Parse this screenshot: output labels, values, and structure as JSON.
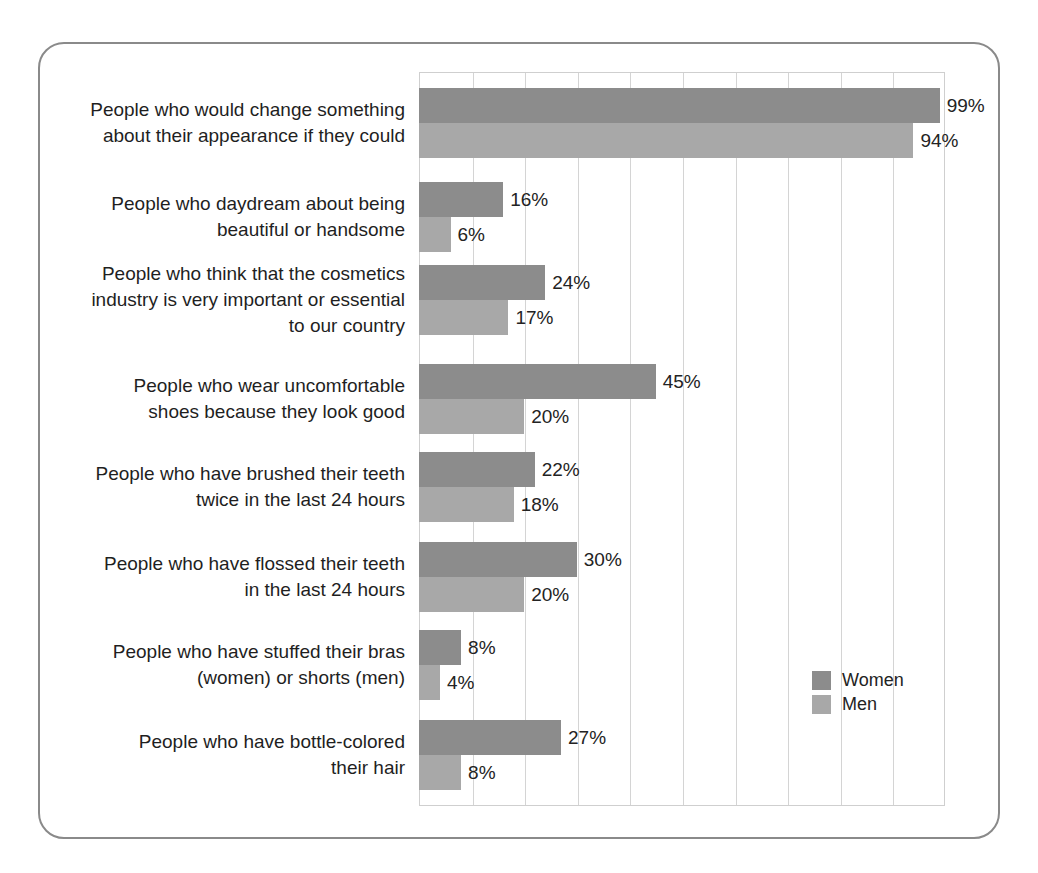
{
  "chart_data": {
    "type": "bar",
    "orientation": "horizontal",
    "title": "",
    "subtitle": "",
    "xlabel": "",
    "ylabel": "",
    "xlim": [
      0,
      100
    ],
    "xtick_labels": [],
    "grid": true,
    "grid_interval": 10,
    "legend_position": "inside-bottom-right",
    "value_suffix": "%",
    "categories": [
      "People who would change something about their appearance if they could",
      "People who daydream about being beautiful or handsome",
      "People who think that the cosmetics industry is very important or essential to our country",
      "People who wear uncomfortable shoes because they look good",
      "People who have brushed their teeth twice in the last 24 hours",
      "People who have flossed their teeth in the last 24 hours",
      "People who have stuffed their bras (women) or shorts (men)",
      "People who have bottle-colored their hair"
    ],
    "category_lines": [
      [
        "People who would change something",
        "about their appearance if they could"
      ],
      [
        "People who daydream about being",
        "beautiful or handsome"
      ],
      [
        "People who think that the cosmetics",
        "industry is very important or essential",
        "to our country"
      ],
      [
        "People who wear uncomfortable",
        "shoes because they look good"
      ],
      [
        "People who have brushed their teeth",
        "twice in the last 24 hours"
      ],
      [
        "People who have flossed their teeth",
        "in the last 24 hours"
      ],
      [
        "People who have stuffed their bras",
        "(women) or shorts (men)"
      ],
      [
        "People who have bottle-colored",
        "their hair"
      ]
    ],
    "series": [
      {
        "name": "Women",
        "color": "#8c8c8c",
        "values": [
          99,
          16,
          24,
          45,
          22,
          30,
          8,
          27
        ],
        "labels": [
          "99%",
          "16%",
          "24%",
          "45%",
          "22%",
          "30%",
          "8%",
          "27%"
        ]
      },
      {
        "name": "Men",
        "color": "#a8a8a8",
        "values": [
          94,
          6,
          17,
          20,
          18,
          20,
          4,
          8
        ],
        "labels": [
          "94%",
          "6%",
          "17%",
          "20%",
          "18%",
          "20%",
          "4%",
          "8%"
        ]
      }
    ]
  },
  "legend": {
    "items": [
      {
        "label": "Women",
        "color": "#8c8c8c"
      },
      {
        "label": "Men",
        "color": "#a8a8a8"
      }
    ]
  },
  "style": {
    "frame_color": "#8a8a8a",
    "grid_color": "#d4d4d4",
    "text_color": "#1f1f1f",
    "background": "#ffffff"
  }
}
